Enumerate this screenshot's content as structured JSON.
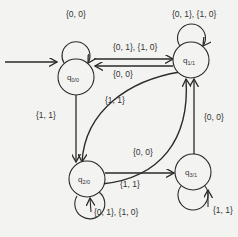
{
  "diagram": {
    "type": "state-machine",
    "start_state": "q0",
    "states": [
      {
        "id": "q0",
        "name": "q",
        "sub": "0/0",
        "label": "q0/0",
        "cx": 76,
        "cy": 77
      },
      {
        "id": "q1",
        "name": "q",
        "sub": "1/1",
        "label": "q1/1",
        "cx": 191,
        "cy": 60
      },
      {
        "id": "q2",
        "name": "q",
        "sub": "2/0",
        "label": "q2/0",
        "cx": 87,
        "cy": 179
      },
      {
        "id": "q3",
        "name": "q",
        "sub": "3/1",
        "label": "q3/1",
        "cx": 193,
        "cy": 172
      }
    ],
    "transitions": [
      {
        "from": "q0",
        "to": "q0",
        "label": "{0, 0}"
      },
      {
        "from": "q1",
        "to": "q1",
        "label": "{0, 1}, {1, 0}"
      },
      {
        "from": "q0",
        "to": "q1",
        "label": "{0, 1}, {1, 0}"
      },
      {
        "from": "q1",
        "to": "q0",
        "label": "{0, 0}"
      },
      {
        "from": "q0",
        "to": "q2",
        "label": "{1, 1}"
      },
      {
        "from": "q1",
        "to": "q2",
        "label": "{1, 1}"
      },
      {
        "from": "q2",
        "to": "q1",
        "label": "{0, 0}"
      },
      {
        "from": "q2",
        "to": "q3",
        "label": "{1, 1}"
      },
      {
        "from": "q3",
        "to": "q1",
        "label": "{0, 0}"
      },
      {
        "from": "q2",
        "to": "q2",
        "label": "{0, 1}, {1, 0}"
      },
      {
        "from": "q3",
        "to": "q3",
        "label": "{1, 1}"
      }
    ]
  }
}
